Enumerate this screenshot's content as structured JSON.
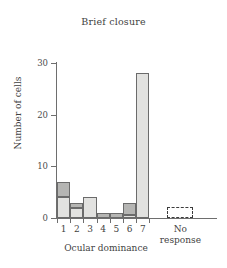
{
  "chart_data": {
    "type": "bar",
    "title": "Brief closure",
    "xlabel": "Ocular dominance",
    "ylabel": "Number of cells",
    "categories": [
      "1",
      "2",
      "3",
      "4",
      "5",
      "6",
      "7"
    ],
    "ylim": [
      0,
      31
    ],
    "yticks": [
      0,
      10,
      20,
      30
    ],
    "ytick_labels": [
      "0",
      "10",
      "20",
      "30"
    ],
    "grid": false,
    "legend": false,
    "stacked": true,
    "series": [
      {
        "name": "light",
        "color": "#e2e2e0",
        "values": [
          4,
          2,
          4,
          0,
          0,
          0.5,
          28
        ]
      },
      {
        "name": "dark",
        "color": "#b5b5b3",
        "values": [
          3,
          1,
          0,
          1,
          1,
          2.5,
          0
        ]
      }
    ],
    "totals": [
      7,
      3,
      4,
      1,
      1,
      3,
      28
    ],
    "annotations": [
      {
        "label": "No response",
        "value": 0,
        "style": "dashed-outline-box"
      }
    ]
  },
  "axis": {
    "no_response_line1": "No",
    "no_response_line2": "response"
  }
}
